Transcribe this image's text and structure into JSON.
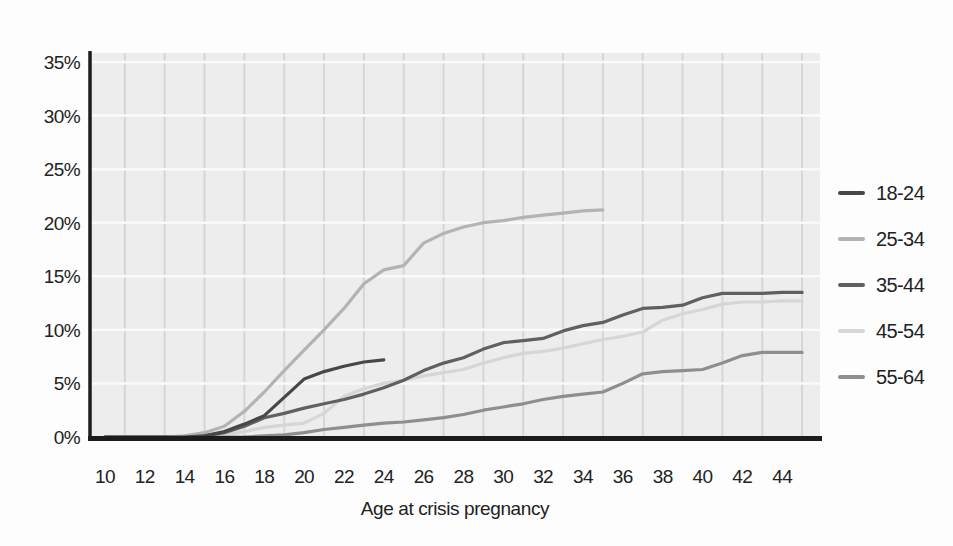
{
  "chart_data": {
    "type": "line",
    "title": "",
    "xlabel": "Age at crisis pregnancy",
    "ylabel": "",
    "x_tick_labels": [
      "10",
      "12",
      "14",
      "16",
      "18",
      "20",
      "22",
      "24",
      "26",
      "28",
      "30",
      "32",
      "34",
      "36",
      "38",
      "40",
      "42",
      "44"
    ],
    "x_tick_ages": [
      10,
      12,
      14,
      16,
      18,
      20,
      22,
      24,
      26,
      28,
      30,
      32,
      34,
      36,
      38,
      40,
      42,
      44
    ],
    "y_tick_labels": [
      "0%",
      "5%",
      "10%",
      "15%",
      "20%",
      "25%",
      "30%",
      "35%"
    ],
    "y_tick_values": [
      0,
      5,
      10,
      15,
      20,
      25,
      30,
      35
    ],
    "xlim": [
      9.25,
      45.9
    ],
    "ylim": [
      0,
      35
    ],
    "grid": "vertical gray lines at odd ages on light-gray plot background, horizontal white lines every 5%",
    "legend_position": "right",
    "ages_start": 10,
    "series": [
      {
        "name": "18-24",
        "color": "#474747",
        "values": [
          0,
          0,
          0,
          0,
          0,
          0.1,
          0.5,
          1.2,
          2.0,
          3.7,
          5.4,
          6.1,
          6.6,
          7.0,
          7.2
        ]
      },
      {
        "name": "25-34",
        "color": "#b3b3b3",
        "values": [
          0,
          0,
          0,
          0,
          0.1,
          0.4,
          1.0,
          2.4,
          4.2,
          6.2,
          8.1,
          10.0,
          12.0,
          14.3,
          15.6,
          16.0,
          18.1,
          19.0,
          19.6,
          20.0,
          20.2,
          20.5,
          20.7,
          20.9,
          21.1,
          21.2
        ]
      },
      {
        "name": "35-44",
        "color": "#606060",
        "values": [
          0,
          0,
          0,
          0,
          0,
          0.1,
          0.4,
          1.0,
          1.8,
          2.2,
          2.7,
          3.1,
          3.5,
          4.0,
          4.6,
          5.3,
          6.2,
          6.9,
          7.4,
          8.2,
          8.8,
          9.0,
          9.2,
          9.9,
          10.4,
          10.7,
          11.4,
          12.0,
          12.1,
          12.3,
          13.0,
          13.4,
          13.4,
          13.4,
          13.5,
          13.5
        ]
      },
      {
        "name": "45-54",
        "color": "#d6d6d6",
        "values": [
          0,
          0,
          0,
          0,
          0,
          0,
          0.2,
          0.5,
          0.9,
          1.1,
          1.3,
          2.2,
          3.8,
          4.5,
          5.0,
          5.3,
          5.7,
          6.0,
          6.3,
          6.9,
          7.4,
          7.8,
          8.0,
          8.3,
          8.7,
          9.1,
          9.4,
          9.8,
          10.9,
          11.5,
          11.9,
          12.4,
          12.6,
          12.6,
          12.7,
          12.7
        ]
      },
      {
        "name": "55-64",
        "color": "#8e8e8e",
        "values": [
          0,
          0,
          0,
          0,
          0,
          0,
          0,
          0,
          0.1,
          0.2,
          0.4,
          0.7,
          0.9,
          1.1,
          1.3,
          1.4,
          1.6,
          1.8,
          2.1,
          2.5,
          2.8,
          3.1,
          3.5,
          3.8,
          4.0,
          4.2,
          5.0,
          5.9,
          6.1,
          6.2,
          6.3,
          6.9,
          7.6,
          7.9,
          7.9,
          7.9
        ]
      }
    ],
    "colors": {
      "plot_background": "#ededed",
      "vertical_gridline": "#d6d6d6",
      "horizontal_gridline": "#fafafa",
      "axis": "#1c1c1c",
      "text": "#222222"
    }
  }
}
